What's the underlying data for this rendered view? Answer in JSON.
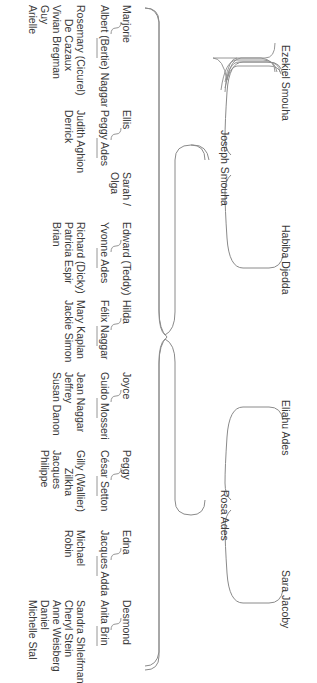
{
  "diagram": {
    "type": "family-tree",
    "orientation": "rotated-90-clockwise",
    "line_color": "#8a8a8a",
    "text_color": "#3a3a3a",
    "grandparents": [
      {
        "name": "Ezekiel Smouha"
      },
      {
        "name": "Habiba Djedda"
      },
      {
        "name": "Eliahu Ades"
      },
      {
        "name": "Sara Jacoby"
      }
    ],
    "parents": [
      {
        "name": "Joseph Smouha",
        "parents": [
          "Ezekiel Smouha",
          "Habiba Djedda"
        ]
      },
      {
        "name": "Rosa Ades",
        "parents": [
          "Eliahu Ades",
          "Sara Jacoby"
        ]
      }
    ],
    "children": [
      {
        "name": "Marjorie",
        "spouse": "Albert (Bertie) Naggar",
        "descendants_heading": "Rosemary (Cicurel)",
        "descendants": [
          "De Cazaux",
          "Vivian Bregman",
          "Guy",
          "Arielle"
        ]
      },
      {
        "name": "Ellis",
        "spouse": "Peggy Ades",
        "descendants_heading": "Judith Aghion",
        "descendants": [
          "Derrick"
        ]
      },
      {
        "name": "Sarah /",
        "name_line2": "Olga",
        "spouse": "",
        "descendants_heading": "",
        "descendants": []
      },
      {
        "name": "Edward (Teddy)",
        "spouse": "Yvonne Ades",
        "descendants_heading": "Richard (Dicky)",
        "descendants": [
          "Patricia Espir",
          "Brian"
        ]
      },
      {
        "name": "Hilda",
        "spouse": "Félix Naggar",
        "descendants_heading": "Mary Kaplan",
        "descendants": [
          "Jackie Simon"
        ]
      },
      {
        "name": "Joyce",
        "spouse": "Guido Mosseri",
        "descendants_heading": "Jean Naggar",
        "descendants": [
          "Jeffrey",
          "Susan Danon"
        ]
      },
      {
        "name": "Peggy",
        "spouse": "César Setton",
        "descendants_heading": "Gilly (Wallier)",
        "descendants": [
          "Zilkha",
          "Jacques",
          "Philippe"
        ]
      },
      {
        "name": "Edna",
        "spouse": "Jacques Adda",
        "descendants_heading": "Michael",
        "descendants": [
          "Robin"
        ]
      },
      {
        "name": "Desmond",
        "spouse": "Anita Brin",
        "descendants_heading": "Sandra Shleifman",
        "descendants": [
          "Cheryl Stein",
          "Anne Weisberg",
          "Daniel",
          "Michelle Stal"
        ]
      }
    ]
  }
}
